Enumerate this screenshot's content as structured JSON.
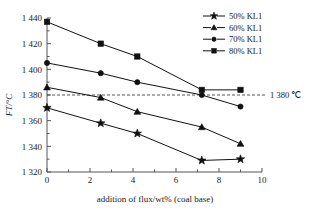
{
  "chart_data": {
    "type": "line",
    "title": "",
    "xlabel": "addition of flux/wt% (coal base)",
    "ylabel": "FT/°C",
    "xlim": [
      0,
      10
    ],
    "ylim": [
      1320,
      1440
    ],
    "x_ticks": [
      "0",
      "2",
      "4",
      "6",
      "8",
      "10"
    ],
    "x_tick_values": [
      0,
      2,
      4,
      6,
      8,
      10
    ],
    "y_ticks": [
      "1 320",
      "1 340",
      "1 360",
      "1 380",
      "1 400",
      "1 420",
      "1 440"
    ],
    "y_tick_values": [
      1320,
      1340,
      1360,
      1380,
      1400,
      1420,
      1440
    ],
    "grid": false,
    "legend_position": "top-right",
    "x": [
      0,
      2.5,
      4.2,
      7.2,
      9.0
    ],
    "series": [
      {
        "name": "50% KL1",
        "marker": "star",
        "values": [
          1370,
          1358,
          1350,
          1329,
          1330
        ]
      },
      {
        "name": "60% KL1",
        "marker": "triangle",
        "values": [
          1386,
          1378,
          1367,
          1355,
          1342
        ]
      },
      {
        "name": "70% KL1",
        "marker": "circle",
        "values": [
          1405,
          1397,
          1390,
          1380,
          1371
        ]
      },
      {
        "name": "80% KL1",
        "marker": "square",
        "values": [
          1437,
          1420,
          1410,
          1384,
          1384
        ]
      }
    ],
    "annotations": [
      {
        "name": "threshold-line",
        "label": "1 380 ℃",
        "y_value": 1380,
        "style": "dashed"
      }
    ]
  },
  "legend": {
    "items": [
      {
        "label": "50% KL1",
        "marker": "star"
      },
      {
        "label": "60% KL1",
        "marker": "triangle"
      },
      {
        "label": "70% KL1",
        "marker": "circle"
      },
      {
        "label": "80% KL1",
        "marker": "square"
      }
    ]
  },
  "colors": {
    "ink": "#111111",
    "axis": "#555555",
    "background": "#ffffff"
  }
}
